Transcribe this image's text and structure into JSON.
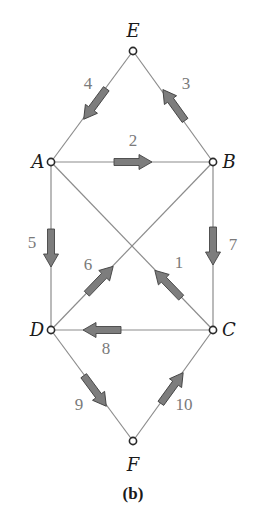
{
  "figure": {
    "caption": "(b)",
    "colors": {
      "edge": "#8c8c8c",
      "arrow_fill": "#7d7d7d",
      "arrow_outline": "#454545",
      "node_outline": "#2a2a2a",
      "edge_label": "#7a7a7a",
      "node_label": "#1a1a1a"
    },
    "nodes": [
      {
        "id": "E",
        "label": "E",
        "x": 133,
        "y": 51
      },
      {
        "id": "A",
        "label": "A",
        "x": 51,
        "y": 162
      },
      {
        "id": "B",
        "label": "B",
        "x": 213,
        "y": 162
      },
      {
        "id": "D",
        "label": "D",
        "x": 51,
        "y": 330
      },
      {
        "id": "C",
        "label": "C",
        "x": 213,
        "y": 330
      },
      {
        "id": "F",
        "label": "F",
        "x": 133,
        "y": 441
      }
    ],
    "edges": [
      {
        "id": "1",
        "label": "1",
        "from": "C",
        "to": "A",
        "direction": "C→A"
      },
      {
        "id": "2",
        "label": "2",
        "from": "A",
        "to": "B",
        "direction": "A→B"
      },
      {
        "id": "3",
        "label": "3",
        "from": "B",
        "to": "E",
        "direction": "B→E"
      },
      {
        "id": "4",
        "label": "4",
        "from": "E",
        "to": "A",
        "direction": "E→A"
      },
      {
        "id": "5",
        "label": "5",
        "from": "A",
        "to": "D",
        "direction": "A→D"
      },
      {
        "id": "6",
        "label": "6",
        "from": "D",
        "to": "B",
        "direction": "D→B"
      },
      {
        "id": "7",
        "label": "7",
        "from": "B",
        "to": "C",
        "direction": "B→C"
      },
      {
        "id": "8",
        "label": "8",
        "from": "C",
        "to": "D",
        "direction": "C→D"
      },
      {
        "id": "9",
        "label": "9",
        "from": "D",
        "to": "F",
        "direction": "D→F"
      },
      {
        "id": "10",
        "label": "10",
        "from": "F",
        "to": "C",
        "direction": "F→C"
      }
    ]
  }
}
